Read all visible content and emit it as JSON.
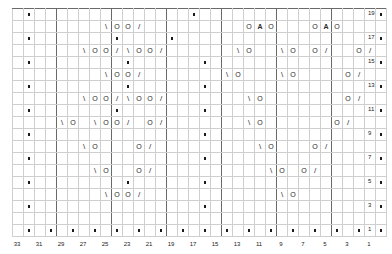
{
  "chart": {
    "kind": "knitting-lace-chart",
    "columns": 34,
    "rows": 19,
    "cell_width_px": 11,
    "cell_height_px": 12,
    "grid_origin": {
      "x": 12,
      "y": 8
    },
    "legend_symbols": {
      "dot": "purl",
      "O": "yarn-over",
      "\\": "ssk-left-leaning-decrease",
      "/": "k2tog-right-leaning-decrease",
      "A": "central-double-decrease"
    },
    "row_numbers": [
      "19",
      "17",
      "15",
      "13",
      "11",
      "9",
      "7",
      "5",
      "3",
      "1"
    ],
    "column_numbers": [
      "33",
      "31",
      "29",
      "27",
      "25",
      "23",
      "21",
      "19",
      "17",
      "15",
      "13",
      "11",
      "9",
      "7",
      "5",
      "3",
      "1"
    ],
    "row_number_side": "right",
    "column_number_side": "bottom",
    "grid_color": "#cfcfcf",
    "major_line_color": "#6a6a6a",
    "symbol_color": "#2b2b2b",
    "background": "#ffffff"
  },
  "chart_data": {
    "type": "table",
    "title": "",
    "xlabel": "",
    "ylabel": "",
    "categories": [
      "34",
      "33",
      "32",
      "31",
      "30",
      "29",
      "28",
      "27",
      "26",
      "25",
      "24",
      "23",
      "22",
      "21",
      "20",
      "19",
      "18",
      "17",
      "16",
      "15",
      "14",
      "13",
      "12",
      "11",
      "10",
      "9",
      "8",
      "7",
      "6",
      "5",
      "4",
      "3",
      "2",
      "1"
    ],
    "rows": [
      {
        "row": 19,
        "cells": [
          "",
          "•",
          "",
          "",
          "",
          "",
          "",
          "",
          "",
          "",
          "",
          "",
          "",
          "",
          "",
          "",
          "•",
          "",
          "",
          "",
          "",
          "",
          "",
          "",
          "",
          "",
          "",
          "",
          "",
          "",
          "",
          "",
          "",
          "•"
        ]
      },
      {
        "row": 18,
        "cells": [
          "",
          "",
          "",
          "",
          "",
          "",
          "",
          "",
          "\\",
          "O",
          "O",
          "/",
          "",
          "",
          "",
          "",
          "",
          "",
          "",
          "",
          "",
          "O",
          "A",
          "O",
          "",
          "",
          "",
          "O",
          "A",
          "O",
          "",
          "",
          "",
          ""
        ]
      },
      {
        "row": 17,
        "cells": [
          "",
          "•",
          "",
          "",
          "",
          "",
          "",
          "",
          "",
          "•",
          "",
          "",
          "",
          "",
          "•",
          "",
          "",
          "",
          "",
          "",
          "",
          "",
          "",
          "",
          "",
          "",
          "",
          "",
          "",
          "",
          "",
          "",
          "",
          "•"
        ]
      },
      {
        "row": 16,
        "cells": [
          "",
          "",
          "",
          "",
          "",
          "",
          "\\",
          "O",
          "O",
          "/",
          "\\",
          "O",
          "O",
          "/",
          "",
          "",
          "",
          "",
          "",
          "",
          "\\",
          "O",
          "",
          "",
          "\\",
          "O",
          "",
          "O",
          "/",
          "",
          "",
          "O",
          "/",
          ""
        ]
      },
      {
        "row": 15,
        "cells": [
          "",
          "•",
          "",
          "",
          "",
          "",
          "",
          "",
          "",
          "",
          "•",
          "",
          "",
          "",
          "",
          "",
          "",
          "•",
          "",
          "",
          "",
          "",
          "",
          "",
          "",
          "",
          "",
          "",
          "",
          "",
          "",
          "",
          "",
          "•"
        ]
      },
      {
        "row": 14,
        "cells": [
          "",
          "",
          "",
          "",
          "",
          "",
          "",
          "",
          "\\",
          "O",
          "O",
          "/",
          "",
          "",
          "",
          "",
          "",
          "",
          "",
          "\\",
          "O",
          "",
          "",
          "",
          "\\",
          "O",
          "",
          "",
          "",
          "",
          "O",
          "/",
          "",
          ""
        ]
      },
      {
        "row": 13,
        "cells": [
          "",
          "•",
          "",
          "",
          "",
          "",
          "",
          "",
          "",
          "",
          "•",
          "",
          "",
          "",
          "",
          "",
          "",
          "•",
          "",
          "",
          "",
          "",
          "",
          "",
          "",
          "",
          "",
          "",
          "",
          "",
          "",
          "",
          "",
          "•"
        ]
      },
      {
        "row": 12,
        "cells": [
          "",
          "",
          "",
          "",
          "",
          "",
          "\\",
          "O",
          "O",
          "/",
          "\\",
          "O",
          "O",
          "/",
          "",
          "",
          "",
          "",
          "",
          "",
          "",
          "\\",
          "O",
          "",
          "",
          "",
          "",
          "",
          "",
          "",
          "O",
          "/",
          "",
          ""
        ]
      },
      {
        "row": 11,
        "cells": [
          "",
          "•",
          "",
          "",
          "",
          "",
          "",
          "",
          "",
          "•",
          "",
          "",
          "",
          "",
          "",
          "",
          "",
          "•",
          "",
          "",
          "",
          "",
          "",
          "",
          "",
          "",
          "",
          "",
          "",
          "",
          "",
          "",
          "",
          "•"
        ]
      },
      {
        "row": 10,
        "cells": [
          "",
          "",
          "",
          "",
          "\\",
          "O",
          "",
          "\\",
          "O",
          "O",
          "/",
          "",
          "O",
          "/",
          "",
          "",
          "",
          "",
          "",
          "",
          "",
          "\\",
          "O",
          "",
          "",
          "",
          "",
          "",
          "",
          "O",
          "/",
          "",
          "",
          ""
        ]
      },
      {
        "row": 9,
        "cells": [
          "",
          "•",
          "",
          "",
          "",
          "",
          "",
          "",
          "",
          "",
          "",
          "",
          "",
          "",
          "",
          "",
          "",
          "•",
          "",
          "",
          "",
          "",
          "",
          "",
          "",
          "",
          "",
          "",
          "",
          "",
          "",
          "",
          "",
          "•"
        ]
      },
      {
        "row": 8,
        "cells": [
          "",
          "",
          "",
          "",
          "",
          "",
          "\\",
          "O",
          "",
          "",
          "",
          "O",
          "/",
          "",
          "",
          "",
          "",
          "",
          "",
          "",
          "",
          "",
          "\\",
          "O",
          "",
          "",
          "",
          "O",
          "/",
          "",
          "",
          "",
          "",
          ""
        ]
      },
      {
        "row": 7,
        "cells": [
          "",
          "•",
          "",
          "",
          "",
          "",
          "",
          "",
          "",
          "",
          "",
          "",
          "",
          "",
          "",
          "",
          "",
          "•",
          "",
          "",
          "",
          "",
          "",
          "",
          "",
          "",
          "",
          "",
          "",
          "",
          "",
          "",
          "",
          "•"
        ]
      },
      {
        "row": 6,
        "cells": [
          "",
          "",
          "",
          "",
          "",
          "",
          "",
          "\\",
          "O",
          "",
          "",
          "O",
          "/",
          "",
          "",
          "",
          "",
          "",
          "",
          "",
          "",
          "",
          "",
          "\\",
          "O",
          "",
          "O",
          "/",
          "",
          "",
          "",
          "",
          "",
          ""
        ]
      },
      {
        "row": 5,
        "cells": [
          "",
          "•",
          "",
          "",
          "",
          "",
          "",
          "",
          "",
          "",
          "•",
          "",
          "",
          "",
          "",
          "",
          "",
          "•",
          "",
          "",
          "",
          "",
          "",
          "",
          "",
          "",
          "",
          "",
          "",
          "",
          "",
          "",
          "",
          "•"
        ]
      },
      {
        "row": 4,
        "cells": [
          "",
          "",
          "",
          "",
          "",
          "",
          "",
          "",
          "\\",
          "O",
          "O",
          "/",
          "",
          "",
          "",
          "",
          "",
          "",
          "",
          "",
          "",
          "",
          "",
          "",
          "\\",
          "O",
          "",
          "",
          "",
          "",
          "",
          "",
          "",
          ""
        ]
      },
      {
        "row": 3,
        "cells": [
          "",
          "•",
          "",
          "",
          "",
          "",
          "",
          "",
          "",
          "",
          "",
          "",
          "",
          "",
          "",
          "",
          "",
          "•",
          "",
          "",
          "",
          "",
          "",
          "",
          "",
          "",
          "",
          "",
          "",
          "",
          "",
          "",
          "",
          "•"
        ]
      },
      {
        "row": 2,
        "cells": [
          "",
          "",
          "",
          "",
          "",
          "",
          "",
          "",
          "",
          "",
          "",
          "",
          "",
          "",
          "",
          "",
          "",
          "",
          "",
          "",
          "",
          "",
          "",
          "",
          "",
          "",
          "",
          "",
          "",
          "",
          "",
          "",
          "",
          ""
        ]
      },
      {
        "row": 1,
        "cells": [
          "",
          "•",
          "",
          "•",
          "",
          "•",
          "",
          "•",
          "",
          "•",
          "",
          "•",
          "",
          "•",
          "",
          "•",
          "",
          "•",
          "",
          "•",
          "",
          "•",
          "",
          "•",
          "",
          "•",
          "",
          "•",
          "",
          "•",
          "",
          "•",
          "",
          "•"
        ]
      }
    ]
  }
}
